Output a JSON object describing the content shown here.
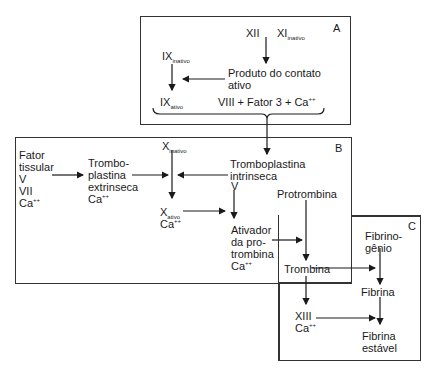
{
  "diagram": {
    "boxes": {
      "A": {
        "label": "A"
      },
      "B": {
        "label": "B"
      },
      "C": {
        "label": "C"
      }
    },
    "nodes": {
      "xii": "XII",
      "xi_base": "XI",
      "xi_sub": "inativo",
      "ix_inativo_base": "IX",
      "ix_inativo_sub": "inativo",
      "produto_contato": "Produto do contato\nativo",
      "ix_ativo_base": "IX",
      "ix_ativo_sub": "ativo",
      "viii_fator3": "VIII + Fator 3 + Ca",
      "viii_sup": "++",
      "fator_tissular": "Fator\ntissular\nV\nVII\nCa",
      "fator_tissular_sup": "++",
      "tromboplastina_extrinseca": "Trombo-\nplastina\nextrinseca\nCa",
      "tromboplastina_extrinseca_sup": "++",
      "x_inativo_base": "X",
      "x_inativo_sub": "inativo",
      "tromboplastina_intrinseca": "Tromboplastina\nintrinseca",
      "v": "V",
      "x_ativo_base": "X",
      "x_ativo_sub": "ativo",
      "x_ativo_ca": "Ca",
      "x_ativo_sup": "++",
      "protrombina": "Protrombina",
      "ativador": "Ativador\nda pro-\ntrombina\nCa",
      "ativador_sup": "++",
      "trombina": "Trombina",
      "fibrinogenio": "Fibrino-\ngênio",
      "fibrina": "Fibrina",
      "xiii": "XIII",
      "xiii_ca": "Ca",
      "xiii_sup": "++",
      "fibrina_estavel": "Fibrina\nestável"
    },
    "colors": {
      "line": "#1a1a1a",
      "border": "#333333",
      "background": "#ffffff"
    }
  }
}
